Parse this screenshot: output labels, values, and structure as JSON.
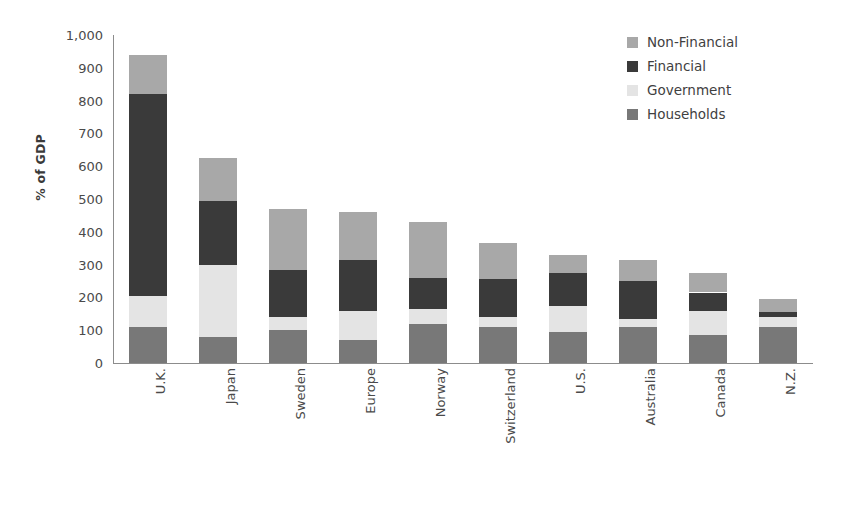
{
  "chart_data": {
    "type": "bar",
    "subtype": "stacked-vertical",
    "title": "",
    "xlabel": "",
    "ylabel": "% of GDP",
    "ylim": [
      0,
      1000
    ],
    "yticks": [
      0,
      100,
      200,
      300,
      400,
      500,
      600,
      700,
      800,
      900,
      1000
    ],
    "ytick_labels": [
      "0",
      "100",
      "200",
      "300",
      "400",
      "500",
      "600",
      "700",
      "800",
      "900",
      "1,000"
    ],
    "grid": false,
    "legend_position": "top-right",
    "categories": [
      "U.K.",
      "Japan",
      "Sweden",
      "Europe",
      "Norway",
      "Switzerland",
      "U.S.",
      "Australia",
      "Canada",
      "N.Z."
    ],
    "series": [
      {
        "name": "Households",
        "color": "#787878",
        "values": [
          110,
          80,
          100,
          70,
          120,
          110,
          95,
          110,
          85,
          110
        ]
      },
      {
        "name": "Government",
        "color": "#e4e4e4",
        "values": [
          95,
          220,
          40,
          90,
          45,
          30,
          80,
          25,
          75,
          30
        ]
      },
      {
        "name": "Financial",
        "color": "#3a3a3a",
        "values": [
          615,
          195,
          145,
          155,
          95,
          115,
          100,
          115,
          55,
          15
        ]
      },
      {
        "name": "Non-Financial",
        "color": "#a8a8a8",
        "values": [
          120,
          130,
          185,
          145,
          170,
          110,
          55,
          65,
          60,
          40
        ]
      }
    ],
    "totals": [
      940,
      625,
      470,
      460,
      430,
      365,
      330,
      315,
      275,
      195
    ],
    "stack_order_bottom_to_top": [
      "Households",
      "Government",
      "Financial",
      "Non-Financial"
    ]
  },
  "legend": {
    "items": [
      {
        "label": "Non-Financial",
        "color": "#a8a8a8"
      },
      {
        "label": "Financial",
        "color": "#3a3a3a"
      },
      {
        "label": "Government",
        "color": "#e4e4e4"
      },
      {
        "label": "Households",
        "color": "#787878"
      }
    ]
  },
  "axes": {
    "y_title": "% of GDP"
  }
}
